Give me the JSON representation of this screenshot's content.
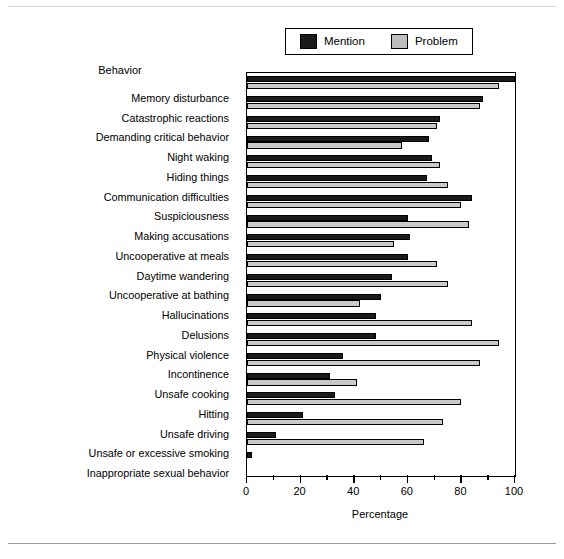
{
  "legend": {
    "position": "top-center",
    "entries": [
      {
        "label": "Mention",
        "color": "#1a1a1a",
        "swatch": "mention"
      },
      {
        "label": "Problem",
        "color": "#c9c9c9",
        "swatch": "problem"
      }
    ]
  },
  "labels_header": "Behavior",
  "xaxis": {
    "title": "Percentage",
    "ticks_major": [
      0,
      20,
      40,
      60,
      80,
      100
    ],
    "ticks_minor": [
      10,
      30,
      50,
      70,
      90
    ],
    "min": 0,
    "max": 100
  },
  "chart_data": {
    "type": "bar",
    "orientation": "horizontal",
    "title": "",
    "subtitle": "",
    "xlabel": "Percentage",
    "ylabel": "Behavior",
    "xlim": [
      0,
      100
    ],
    "grid": false,
    "legend_position": "top-center",
    "categories": [
      "Memory disturbance",
      "Catastrophic reactions",
      "Demanding critical behavior",
      "Night waking",
      "Hiding things",
      "Communication difficulties",
      "Suspiciousness",
      "Making accusations",
      "Uncooperative at meals",
      "Daytime wandering",
      "Uncooperative at bathing",
      "Hallucinations",
      "Delusions",
      "Physical violence",
      "Incontinence",
      "Unsafe cooking",
      "Hitting",
      "Unsafe driving",
      "Unsafe or excessive smoking",
      "Inappropriate sexual behavior"
    ],
    "series": [
      {
        "name": "Mention",
        "color": "#1a1a1a",
        "values": [
          100,
          88,
          72,
          68,
          69,
          67,
          84,
          60,
          61,
          60,
          54,
          50,
          48,
          48,
          36,
          31,
          33,
          21,
          11,
          2
        ]
      },
      {
        "name": "Problem",
        "color": "#c9c9c9",
        "values": [
          94,
          87,
          71,
          58,
          72,
          75,
          80,
          83,
          55,
          71,
          75,
          42,
          84,
          94,
          87,
          41,
          80,
          73,
          66,
          0
        ]
      }
    ]
  }
}
